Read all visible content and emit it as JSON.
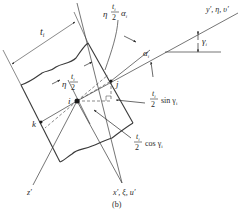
{
  "figure": {
    "caption": "(b)",
    "labels": {
      "width": "t",
      "width_sub": "i",
      "eta_half_alpha": {
        "eta": "η",
        "num": "t",
        "num_sub": "i",
        "den": "2",
        "alpha": "α",
        "alpha_sub": "i"
      },
      "eta_half": {
        "eta": "η",
        "num": "t",
        "num_sub": "i",
        "den": "2"
      },
      "alpha": {
        "sym": "α",
        "sub": "i"
      },
      "gamma": {
        "sym": "γ",
        "sub": "i"
      },
      "y_axis": "y′, η, υ′",
      "x_axis": "x′, ξ, u′",
      "z_axis": "z′",
      "point_i": "i",
      "point_j": "j",
      "point_k": "k",
      "half_sin": {
        "num": "t",
        "num_sub": "i",
        "den": "2",
        "fn": "sin γ",
        "fn_sub": "i"
      },
      "half_cos": {
        "num": "t",
        "num_sub": "i",
        "den": "2",
        "fn": "cos γ",
        "fn_sub": "i"
      }
    },
    "colors": {
      "line": "#3a3a3a",
      "text": "#2a2a2a",
      "background": "#ffffff"
    }
  }
}
